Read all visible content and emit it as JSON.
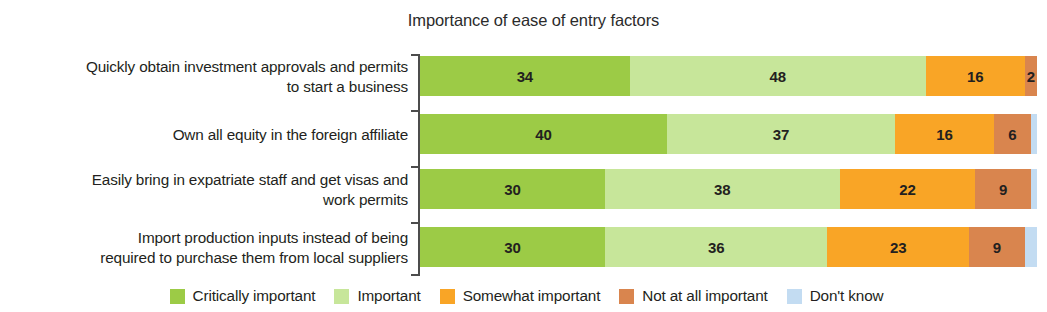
{
  "chart_data": {
    "type": "bar",
    "title": "Importance of ease of entry factors",
    "xlabel": "",
    "ylabel": "",
    "orientation": "horizontal",
    "stacked": true,
    "normalized_percent": true,
    "xlim": [
      0,
      100
    ],
    "grid": false,
    "legend_position": "bottom",
    "categories": [
      "Quickly obtain investment approvals and permits\nto start a business",
      "Own all equity in the foreign affiliate",
      "Easily bring in expatriate staff and get visas and\nwork permits",
      "Import production inputs instead of being\nrequired to purchase them from local suppliers"
    ],
    "series": [
      {
        "name": "Critically important",
        "color": "#9CCB46",
        "values": [
          34,
          40,
          30,
          30
        ]
      },
      {
        "name": "Important",
        "color": "#C7E69A",
        "values": [
          48,
          37,
          38,
          36
        ]
      },
      {
        "name": "Somewhat important",
        "color": "#F9A526",
        "values": [
          16,
          16,
          22,
          23
        ]
      },
      {
        "name": "Not at all important",
        "color": "#D9854E",
        "values": [
          2,
          6,
          9,
          9
        ]
      },
      {
        "name": "Don't know",
        "color": "#C3DCF2",
        "values": [
          0,
          1,
          1,
          2
        ]
      }
    ],
    "rows": [
      {
        "label": "Quickly obtain investment approvals and permits\nto start a business",
        "label_lines": 2,
        "segments": [
          {
            "series": "Critically important",
            "value": 34,
            "label": "34",
            "color": "#9CCB46",
            "show_label": true
          },
          {
            "series": "Important",
            "value": 48,
            "label": "48",
            "color": "#C7E69A",
            "show_label": true
          },
          {
            "series": "Somewhat important",
            "value": 16,
            "label": "16",
            "color": "#F9A526",
            "show_label": true
          },
          {
            "series": "Not at all important",
            "value": 2,
            "label": "2",
            "color": "#D9854E",
            "show_label": true
          }
        ]
      },
      {
        "label": "Own all equity in the foreign affiliate",
        "label_lines": 1,
        "segments": [
          {
            "series": "Critically important",
            "value": 40,
            "label": "40",
            "color": "#9CCB46",
            "show_label": true
          },
          {
            "series": "Important",
            "value": 37,
            "label": "37",
            "color": "#C7E69A",
            "show_label": true
          },
          {
            "series": "Somewhat important",
            "value": 16,
            "label": "16",
            "color": "#F9A526",
            "show_label": true
          },
          {
            "series": "Not at all important",
            "value": 6,
            "label": "6",
            "color": "#D9854E",
            "show_label": true
          },
          {
            "series": "Don't know",
            "value": 1,
            "label": "",
            "color": "#C3DCF2",
            "show_label": false
          }
        ]
      },
      {
        "label": "Easily bring in expatriate staff and get visas and\nwork permits",
        "label_lines": 2,
        "segments": [
          {
            "series": "Critically important",
            "value": 30,
            "label": "30",
            "color": "#9CCB46",
            "show_label": true
          },
          {
            "series": "Important",
            "value": 38,
            "label": "38",
            "color": "#C7E69A",
            "show_label": true
          },
          {
            "series": "Somewhat important",
            "value": 22,
            "label": "22",
            "color": "#F9A526",
            "show_label": true
          },
          {
            "series": "Not at all important",
            "value": 9,
            "label": "9",
            "color": "#D9854E",
            "show_label": true
          },
          {
            "series": "Don't know",
            "value": 1,
            "label": "",
            "color": "#C3DCF2",
            "show_label": false
          }
        ]
      },
      {
        "label": "Import production inputs instead of being\nrequired to purchase them from local suppliers",
        "label_lines": 2,
        "segments": [
          {
            "series": "Critically important",
            "value": 30,
            "label": "30",
            "color": "#9CCB46",
            "show_label": true
          },
          {
            "series": "Important",
            "value": 36,
            "label": "36",
            "color": "#C7E69A",
            "show_label": true
          },
          {
            "series": "Somewhat important",
            "value": 23,
            "label": "23",
            "color": "#F9A526",
            "show_label": true
          },
          {
            "series": "Not at all important",
            "value": 9,
            "label": "9",
            "color": "#D9854E",
            "show_label": true
          },
          {
            "series": "Don't know",
            "value": 2,
            "label": "",
            "color": "#C3DCF2",
            "show_label": false
          }
        ]
      }
    ],
    "legend": [
      {
        "label": "Critically important",
        "color": "#9CCB46"
      },
      {
        "label": "Important",
        "color": "#C7E69A"
      },
      {
        "label": "Somewhat important",
        "color": "#F9A526"
      },
      {
        "label": "Not at all important",
        "color": "#D9854E"
      },
      {
        "label": "Don't know",
        "color": "#C3DCF2"
      }
    ]
  },
  "layout": {
    "px_per_unit": 6.17,
    "plot_left": 420,
    "row_tops": [
      6,
      64,
      119,
      177
    ],
    "axis_tick_tops": [
      4,
      60,
      116,
      172,
      224
    ]
  }
}
